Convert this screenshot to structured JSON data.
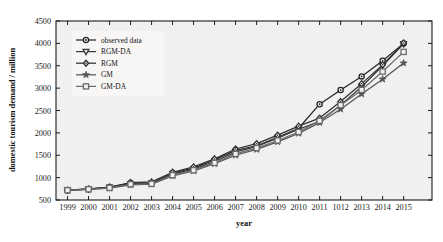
{
  "chart_data": {
    "type": "line",
    "title": "",
    "xlabel": "year",
    "ylabel": "domestic tourism demand / million",
    "x": [
      1999,
      2000,
      2001,
      2002,
      2003,
      2004,
      2005,
      2006,
      2007,
      2008,
      2009,
      2010,
      2011,
      2012,
      2013,
      2014,
      2015
    ],
    "xtick_labels": [
      "1999",
      "2000",
      "2001",
      "2002",
      "2003",
      "2004",
      "2005",
      "2006",
      "2007",
      "2008",
      "2009",
      "2010",
      "2011",
      "1012",
      "2013",
      "2014",
      "2015"
    ],
    "ytick_labels": [
      "500",
      "1000",
      "1500",
      "2000",
      "2500",
      "3000",
      "3500",
      "4000",
      "4500"
    ],
    "ytick_values": [
      500,
      1000,
      1500,
      2000,
      2500,
      3000,
      3500,
      4000,
      4500
    ],
    "xlim": [
      1998.45,
      1999.0
    ],
    "ylim": [
      500,
      4500
    ],
    "grid": false,
    "legend_position": "upper left",
    "series": [
      {
        "name": "observed data",
        "marker": "circle",
        "color": "#262626",
        "values": [
          719,
          744,
          784,
          878,
          870,
          1102,
          1212,
          1394,
          1610,
          1712,
          1902,
          2103,
          2641,
          2957,
          3262,
          3611,
          4000
        ]
      },
      {
        "name": "RGM-DA",
        "marker": "triangle-down",
        "color": "#3a3a3a",
        "values": [
          719,
          742,
          780,
          862,
          880,
          1080,
          1190,
          1360,
          1570,
          1700,
          1880,
          2080,
          2260,
          2620,
          3030,
          3500,
          3990
        ]
      },
      {
        "name": "RGM",
        "marker": "diamond",
        "color": "#303030",
        "values": [
          719,
          748,
          790,
          890,
          905,
          1120,
          1240,
          1420,
          1640,
          1760,
          1950,
          2150,
          2330,
          2700,
          3100,
          3520,
          4010
        ]
      },
      {
        "name": "GM",
        "marker": "star",
        "color": "#555555",
        "values": [
          715,
          735,
          765,
          840,
          855,
          1040,
          1150,
          1310,
          1500,
          1630,
          1800,
          1990,
          2230,
          2530,
          2870,
          3200,
          3560
        ]
      },
      {
        "name": "GM-DA",
        "marker": "square",
        "color": "#6b6b6b",
        "values": [
          719,
          740,
          772,
          852,
          862,
          1055,
          1165,
          1330,
          1530,
          1660,
          1830,
          2020,
          2270,
          2620,
          2960,
          3370,
          3810
        ]
      }
    ]
  }
}
